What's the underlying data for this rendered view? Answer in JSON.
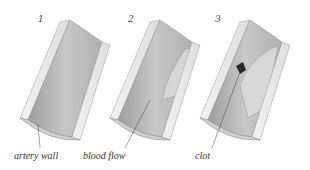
{
  "figure": {
    "panels": [
      {
        "number": "1",
        "label": "artery wall",
        "state": "healthy"
      },
      {
        "number": "2",
        "label": "blood flow",
        "state": "plaque"
      },
      {
        "number": "3",
        "label": "clot",
        "state": "clot"
      }
    ]
  },
  "colors": {
    "wall": "#e4e4e4",
    "lumen": "#bdbdbd",
    "plaque": "#d6d6d6",
    "clot": "#2a2a2a",
    "text": "#333333"
  }
}
